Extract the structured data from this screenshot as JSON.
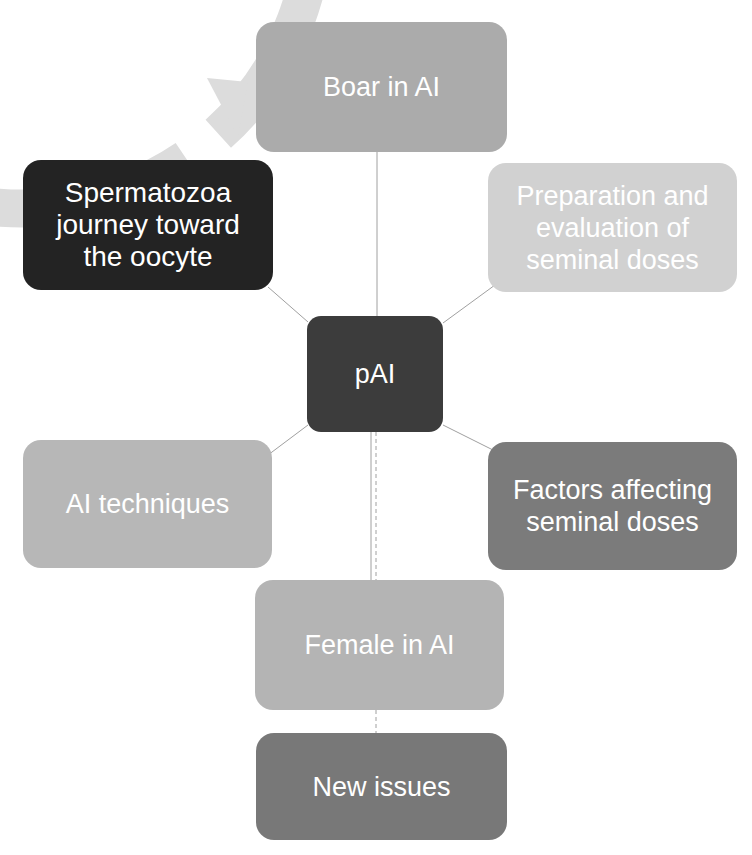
{
  "diagram": {
    "type": "cycle-with-center",
    "center": {
      "label": "pAI",
      "color": "#3c3c3c"
    },
    "cycle_color": "#dcdcdc",
    "connector_color": "#a0a0a0",
    "nodes": [
      {
        "id": "boar",
        "label": "Boar in AI",
        "color": "#ababab"
      },
      {
        "id": "prep",
        "label": "Preparation and\nevaluation of\nseminal doses",
        "color": "#d1d1d1"
      },
      {
        "id": "fact",
        "label": "Factors affecting\nseminal doses",
        "color": "#7b7b7b"
      },
      {
        "id": "fem",
        "label": "Female in AI",
        "color": "#b4b4b4"
      },
      {
        "id": "tech",
        "label": "AI techniques",
        "color": "#b7b7b7"
      },
      {
        "id": "sperm",
        "label": "Spermatozoa\njourney toward\nthe oocyte",
        "color": "#232323"
      }
    ],
    "extra_node": {
      "id": "new",
      "label": "New issues",
      "color": "#787878"
    },
    "cycle_direction": "clockwise"
  }
}
